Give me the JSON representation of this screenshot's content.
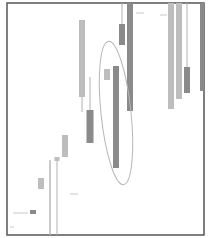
{
  "chart_data": {
    "type": "candlestick",
    "title": "",
    "xlabel": "",
    "ylabel": "",
    "grid": false,
    "legend": null,
    "frame": {
      "x": 7,
      "y": 3,
      "w": 197,
      "h": 232,
      "stroke": "#555555"
    },
    "colors": {
      "light": "#bdbdbd",
      "dark": "#8a8a8a",
      "wick": "#b0b0b0",
      "ellipse": "#b5b5b5",
      "dash": "#c8c8c8"
    },
    "candles": [
      {
        "x": 33,
        "w": 6,
        "body_top": 210,
        "body_bottom": 214,
        "wick_top": 210,
        "wick_bottom": 214,
        "shade": "dark"
      },
      {
        "x": 41,
        "w": 6,
        "body_top": 178,
        "body_bottom": 189,
        "wick_top": 178,
        "wick_bottom": 189,
        "shade": "light"
      },
      {
        "x": 50,
        "w": 1,
        "body_top": 160,
        "body_bottom": 235,
        "wick_top": 160,
        "wick_bottom": 235,
        "shade": "light"
      },
      {
        "x": 57,
        "w": 5,
        "body_top": 157,
        "body_bottom": 161,
        "wick_top": 157,
        "wick_bottom": 235,
        "shade": "light"
      },
      {
        "x": 65,
        "w": 6,
        "body_top": 135,
        "body_bottom": 157,
        "wick_top": 135,
        "wick_bottom": 157,
        "shade": "light"
      },
      {
        "x": 82,
        "w": 6,
        "body_top": 20,
        "body_bottom": 97,
        "wick_top": 20,
        "wick_bottom": 112,
        "shade": "light"
      },
      {
        "x": 90,
        "w": 7,
        "body_top": 110,
        "body_bottom": 143,
        "wick_top": 77,
        "wick_bottom": 143,
        "shade": "dark"
      },
      {
        "x": 107,
        "w": 6,
        "body_top": 69,
        "body_bottom": 80,
        "wick_top": 69,
        "wick_bottom": 80,
        "shade": "light"
      },
      {
        "x": 116,
        "w": 6,
        "body_top": 66,
        "body_bottom": 168,
        "wick_top": 66,
        "wick_bottom": 168,
        "shade": "dark"
      },
      {
        "x": 122,
        "w": 6,
        "body_top": 24,
        "body_bottom": 45,
        "wick_top": 3,
        "wick_bottom": 45,
        "shade": "dark"
      },
      {
        "x": 130,
        "w": 6,
        "body_top": 3,
        "body_bottom": 111,
        "wick_top": 3,
        "wick_bottom": 111,
        "shade": "dark"
      },
      {
        "x": 171,
        "w": 6,
        "body_top": 3,
        "body_bottom": 109,
        "wick_top": 3,
        "wick_bottom": 109,
        "shade": "light"
      },
      {
        "x": 179,
        "w": 6,
        "body_top": 3,
        "body_bottom": 99,
        "wick_top": 3,
        "wick_bottom": 99,
        "shade": "light"
      },
      {
        "x": 187,
        "w": 6,
        "body_top": 67,
        "body_bottom": 93,
        "wick_top": 3,
        "wick_bottom": 67,
        "shade": "dark"
      },
      {
        "x": 202,
        "w": 4,
        "body_top": 3,
        "body_bottom": 91,
        "wick_top": 3,
        "wick_bottom": 91,
        "shade": "dark"
      }
    ],
    "dashes": [
      {
        "x1": 13,
        "x2": 28,
        "y": 213
      },
      {
        "x1": 70,
        "x2": 78,
        "y": 194
      },
      {
        "x1": 136,
        "x2": 144,
        "y": 13
      },
      {
        "x1": 160,
        "x2": 167,
        "y": 15
      },
      {
        "x1": 10,
        "x2": 14,
        "y": 227
      }
    ],
    "annotation": {
      "type": "ellipse",
      "cx": 116,
      "cy": 113,
      "rx": 15,
      "ry": 72,
      "rotate": -6
    }
  }
}
